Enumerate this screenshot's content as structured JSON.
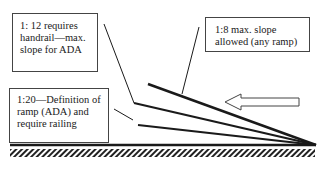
{
  "diagram": {
    "labels": {
      "slope_1_12": "1: 12  requires handrail—max. slope for ADA",
      "slope_1_8": "1:8 max. slope allowed (any ramp)",
      "slope_1_20": "1:20—Definition of ramp (ADA) and require railing"
    },
    "slopes": [
      {
        "ratio": "1:8",
        "description": "max. slope allowed (any ramp)"
      },
      {
        "ratio": "1:12",
        "description": "requires handrail—max. slope for ADA"
      },
      {
        "ratio": "1:20",
        "description": "Definition of ramp (ADA) and require railing"
      }
    ],
    "elements": {
      "arrow": "left-pointing-outline-arrow",
      "ground": "hatched-ground-line"
    },
    "colors": {
      "line": "#1a1a1a",
      "box_border": "#444444",
      "background": "#ffffff"
    }
  }
}
